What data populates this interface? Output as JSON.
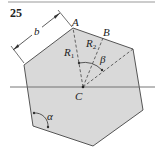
{
  "figure": {
    "number": "25",
    "colors": {
      "fill": "#d9d9d9",
      "stroke": "#555555",
      "rule": "#888888",
      "text": "#222222"
    },
    "points": {
      "A": {
        "label": "A"
      },
      "B": {
        "label": "B"
      },
      "C": {
        "label": "C"
      }
    },
    "labels": {
      "b": "b",
      "R1": "R",
      "R1_sub": "1",
      "R2": "R",
      "R2_sub": "2",
      "beta": "β",
      "alpha": "α"
    }
  }
}
